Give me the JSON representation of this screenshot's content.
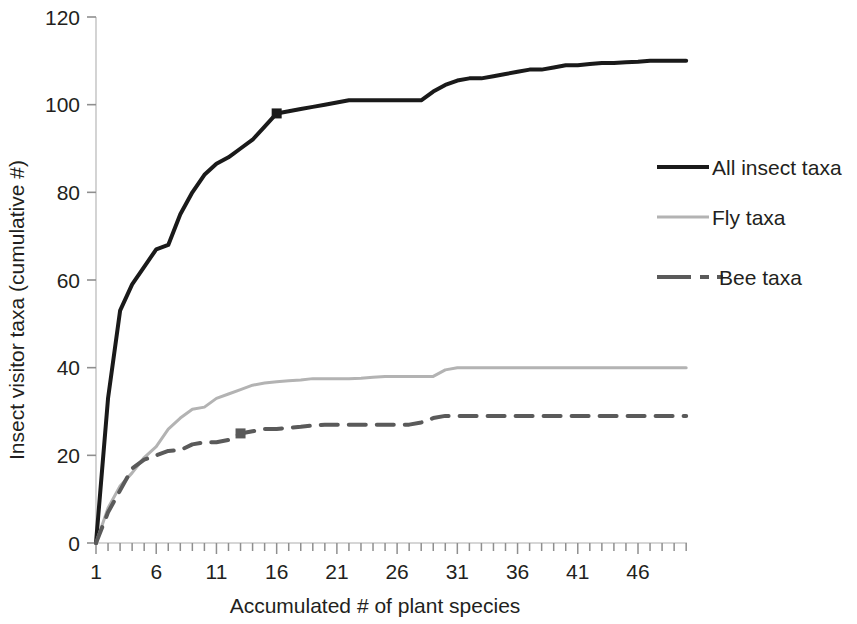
{
  "chart_data": {
    "type": "line",
    "title": "",
    "subtitle": "",
    "xlabel": "Accumulated # of plant species",
    "ylabel": "Insect visitor taxa (cumulative #)",
    "xlim": [
      1,
      50
    ],
    "ylim": [
      0,
      120
    ],
    "xticks": [
      1,
      6,
      11,
      16,
      21,
      26,
      31,
      36,
      41,
      46
    ],
    "xtick_labels": [
      "1",
      "6",
      "11",
      "16",
      "21",
      "26",
      "31",
      "36",
      "41",
      "46"
    ],
    "yticks": [
      0,
      20,
      40,
      60,
      80,
      100,
      120
    ],
    "ytick_labels": [
      "0",
      "20",
      "40",
      "60",
      "80",
      "100",
      "120"
    ],
    "x_minor_tick_interval": 1,
    "grid": false,
    "legend_position": "right",
    "x": [
      1,
      2,
      3,
      4,
      5,
      6,
      7,
      8,
      9,
      10,
      11,
      12,
      13,
      14,
      15,
      16,
      17,
      18,
      19,
      20,
      21,
      22,
      23,
      24,
      25,
      26,
      27,
      28,
      29,
      30,
      31,
      32,
      33,
      34,
      35,
      36,
      37,
      38,
      39,
      40,
      41,
      42,
      43,
      44,
      45,
      46,
      47,
      48,
      49,
      50
    ],
    "series": [
      {
        "name": "All insect taxa",
        "color": "#1a1a1a",
        "style": "solid",
        "width": 4,
        "marker_points": [
          {
            "x": 16,
            "y": 98
          }
        ],
        "values": [
          0,
          33,
          53,
          59,
          63,
          67,
          68,
          75,
          80,
          84,
          86.5,
          88,
          90,
          92,
          95,
          98,
          98.5,
          99,
          99.5,
          100,
          100.5,
          101,
          101,
          101,
          101,
          101,
          101,
          101,
          103,
          104.5,
          105.5,
          106,
          106,
          106.5,
          107,
          107.5,
          108,
          108,
          108.5,
          109,
          109,
          109.3,
          109.5,
          109.5,
          109.7,
          109.8,
          110,
          110,
          110,
          110
        ]
      },
      {
        "name": "Fly taxa",
        "color": "#b3b3b3",
        "style": "solid",
        "width": 3,
        "marker_points": [],
        "values": [
          0,
          8,
          13,
          16,
          19.5,
          22,
          26,
          28.5,
          30.5,
          31,
          33,
          34,
          35,
          36,
          36.5,
          36.8,
          37,
          37.2,
          37.5,
          37.5,
          37.5,
          37.5,
          37.6,
          37.8,
          38,
          38,
          38,
          38,
          38,
          39.5,
          40,
          40,
          40,
          40,
          40,
          40,
          40,
          40,
          40,
          40,
          40,
          40,
          40,
          40,
          40,
          40,
          40,
          40,
          40,
          40
        ]
      },
      {
        "name": "Bee taxa",
        "color": "#5a5a5a",
        "style": "dashed",
        "width": 4,
        "marker_points": [
          {
            "x": 13,
            "y": 25
          }
        ],
        "values": [
          0,
          7,
          12,
          17,
          19,
          20,
          21,
          21.2,
          22.5,
          23,
          23,
          23.5,
          25,
          25.5,
          26,
          26,
          26.3,
          26.5,
          26.8,
          27,
          27,
          27,
          27,
          27,
          27,
          27,
          27,
          27.5,
          28.5,
          29,
          29,
          29,
          29,
          29,
          29,
          29,
          29,
          29,
          29,
          29,
          29,
          29,
          29,
          29,
          29,
          29,
          29,
          29,
          29,
          29
        ]
      }
    ]
  },
  "legend": {
    "entries": [
      {
        "label": "All insect taxa"
      },
      {
        "label": "Fly taxa"
      },
      {
        "label": "Bee taxa"
      }
    ]
  },
  "axes": {
    "y_axis_title": "Insect visitor taxa (cumulative #)",
    "x_axis_title": "Accumulated # of plant species"
  }
}
